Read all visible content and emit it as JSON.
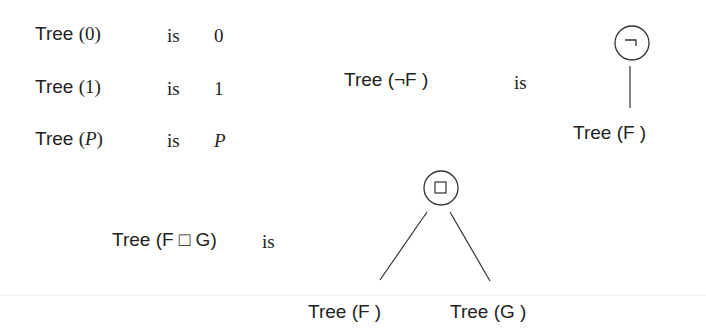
{
  "definitions": {
    "zero": {
      "lhs_func": "Tree",
      "lhs_arg": "0",
      "verb": "is",
      "rhs": "0"
    },
    "one": {
      "lhs_func": "Tree",
      "lhs_arg": "1",
      "verb": "is",
      "rhs": "1"
    },
    "var": {
      "lhs_func": "Tree",
      "lhs_arg": "P",
      "verb": "is",
      "rhs": "P"
    },
    "neg": {
      "lhs": "Tree (¬F )",
      "verb": "is",
      "node_symbol": "¬",
      "child": "Tree (F )"
    },
    "binary": {
      "lhs": "Tree (F □ G)",
      "verb": "is",
      "node_symbol": "□",
      "left_child": "Tree (F )",
      "right_child": "Tree (G )"
    }
  },
  "colors": {
    "ink": "#222222",
    "separator": "#ececec"
  }
}
